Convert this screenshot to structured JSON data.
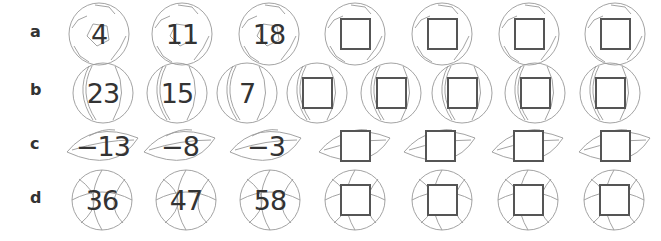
{
  "rows": [
    {
      "label": "a",
      "ball": "soccer-ball",
      "values": [
        "4",
        "11",
        "18",
        "",
        "",
        "",
        ""
      ]
    },
    {
      "label": "b",
      "ball": "tennis-ball",
      "values": [
        "23",
        "15",
        "7",
        "",
        "",
        "",
        "",
        ""
      ]
    },
    {
      "label": "c",
      "ball": "american-football",
      "values": [
        "−13",
        "−8",
        "−3",
        "",
        "",
        "",
        ""
      ]
    },
    {
      "label": "d",
      "ball": "basketball",
      "values": [
        "36",
        "47",
        "58",
        "",
        "",
        "",
        ""
      ]
    }
  ],
  "colors": {
    "text": "#333333",
    "outline": "#999999",
    "box": "#555555"
  }
}
